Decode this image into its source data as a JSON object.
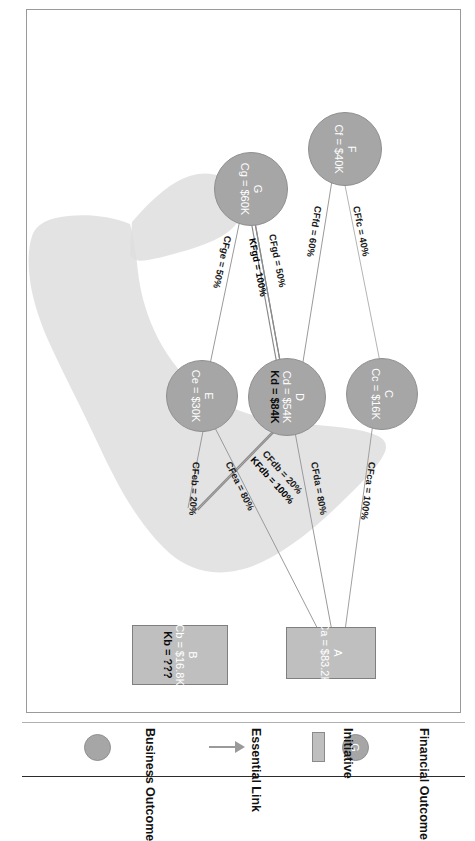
{
  "diagram": {
    "type": "benefits-dependency-network",
    "nodes": [
      {
        "id": "A",
        "shape": "rect",
        "kind": "initiative",
        "label": "A",
        "lines": [
          "Ca = $83.2K"
        ],
        "bold_lines": []
      },
      {
        "id": "B",
        "shape": "rect",
        "kind": "initiative",
        "label": "B",
        "lines": [
          "Cb = $16.8K"
        ],
        "bold_lines": [
          "Kb = ???"
        ]
      },
      {
        "id": "C",
        "shape": "circle",
        "kind": "business-outcome",
        "label": "C",
        "lines": [
          "Cc = $16K"
        ],
        "bold_lines": []
      },
      {
        "id": "D",
        "shape": "circle",
        "kind": "business-outcome",
        "label": "D",
        "lines": [
          "Cd = $54K"
        ],
        "bold_lines": [
          "Kd = $84K"
        ]
      },
      {
        "id": "E",
        "shape": "circle",
        "kind": "business-outcome",
        "label": "E",
        "lines": [
          "Ce = $30K"
        ],
        "bold_lines": []
      },
      {
        "id": "F",
        "shape": "circle",
        "kind": "financial-outcome",
        "label": "F",
        "lines": [
          "Cf = $40K"
        ],
        "bold_lines": []
      },
      {
        "id": "G",
        "shape": "circle",
        "kind": "financial-outcome",
        "label": "G",
        "lines": [
          "Cg = $60K"
        ],
        "bold_lines": []
      }
    ],
    "edges": [
      {
        "from": "C",
        "to": "A",
        "label": "CFca = 100%",
        "bold": false
      },
      {
        "from": "D",
        "to": "A",
        "label": "CFda = 80%",
        "bold": false
      },
      {
        "from": "D",
        "to": "B",
        "label": "CFdb = 20%",
        "bold": false
      },
      {
        "from": "D",
        "to": "B",
        "label": "KFdb = 100%",
        "bold": true
      },
      {
        "from": "E",
        "to": "A",
        "label": "CFea = 80%",
        "bold": false
      },
      {
        "from": "E",
        "to": "B",
        "label": "CFeb = 20%",
        "bold": false
      },
      {
        "from": "F",
        "to": "C",
        "label": "CFfc = 40%",
        "bold": false
      },
      {
        "from": "F",
        "to": "D",
        "label": "CFfd = 60%",
        "bold": false
      },
      {
        "from": "G",
        "to": "D",
        "label": "CFgd = 50%",
        "bold": false
      },
      {
        "from": "G",
        "to": "D",
        "label": "KFgd = 100%",
        "bold": true
      },
      {
        "from": "G",
        "to": "E",
        "label": "CFge = 50%",
        "bold": false
      }
    ],
    "node_text": {
      "A": {
        "id": "A",
        "c": "Ca = $83.2K"
      },
      "B": {
        "id": "B",
        "c": "Cb = $16.8K",
        "k": "Kb = ???"
      },
      "C": {
        "id": "C",
        "c": "Cc = $16K"
      },
      "D": {
        "id": "D",
        "c": "Cd = $54K",
        "k": "Kd = $84K"
      },
      "E": {
        "id": "E",
        "c": "Ce = $30K"
      },
      "F": {
        "id": "F",
        "c": "Cf = $40K"
      },
      "G": {
        "id": "G",
        "c": "Cg = $60K"
      }
    },
    "edge_text": {
      "ca": "CFca = 100%",
      "da": "CFda = 80%",
      "db": "CFdb = 20%",
      "kdb": "KFdb = 100%",
      "ea": "CFea = 80%",
      "eb": "CFeb = 20%",
      "fc": "CFfc = 40%",
      "fd": "CFfd = 60%",
      "gd": "CFgd = 50%",
      "kgd": "KFgd = 100%",
      "ge": "CFge = 50%"
    }
  },
  "legend": {
    "items": [
      {
        "key": "initiative",
        "label": "Initiative",
        "swatch": "rectangle-swatch"
      },
      {
        "key": "essential-link",
        "label": "Essential Link",
        "swatch": "arrow-icon"
      },
      {
        "key": "business-outcome",
        "label": "Business Outcome",
        "swatch": "circle-swatch"
      },
      {
        "key": "financial-outcome",
        "label": "Financial Outcome",
        "swatch": "circle-swatch-g",
        "swatch_label": "G"
      }
    ],
    "initiative_label": "Initiative",
    "essential_link_label": "Essential Link",
    "business_outcome_label": "Business Outcome",
    "financial_outcome_label": "Financial Outcome",
    "financial_outcome_swatch_label": "G"
  },
  "colors": {
    "circle_fill": "#a6a6a6",
    "rect_fill": "#bfbfbf",
    "blob_fill": "#d9d9d9",
    "link_stroke": "#8c8c8c",
    "text_light": "#ffffff",
    "text_dark": "#1a1a1a"
  }
}
